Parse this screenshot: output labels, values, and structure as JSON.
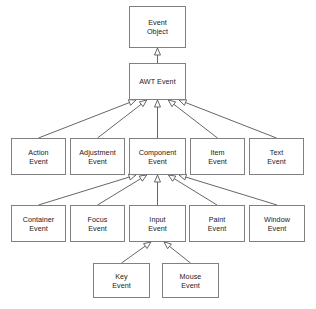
{
  "diagram": {
    "type": "uml-class-hierarchy",
    "relationship": "generalization",
    "arrow_style": "hollow-triangle",
    "colors": {
      "background": "#ffffff",
      "box_fill": "#ffffff",
      "box_border": "#808080",
      "edge_line": "#555555",
      "text": "#1a1a1a"
    },
    "nodes": [
      {
        "id": "event_object",
        "label": "Event\nObject",
        "x": 129,
        "y": 6,
        "w": 57,
        "h": 42,
        "level": 0
      },
      {
        "id": "awt_event",
        "label": "AWT Event",
        "x": 129,
        "y": 63,
        "w": 57,
        "h": 37,
        "level": 1
      },
      {
        "id": "action_event",
        "label": "Action\nEvent",
        "x": 11,
        "y": 138,
        "w": 55,
        "h": 37,
        "level": 2
      },
      {
        "id": "adjustment_event",
        "label": "Adjustment\nEvent",
        "x": 70,
        "y": 138,
        "w": 55,
        "h": 37,
        "level": 2
      },
      {
        "id": "component_event",
        "label": "Component\nEvent",
        "x": 129,
        "y": 138,
        "w": 57,
        "h": 37,
        "level": 2
      },
      {
        "id": "item_event",
        "label": "Item\nEvent",
        "x": 190,
        "y": 138,
        "w": 55,
        "h": 37,
        "level": 2
      },
      {
        "id": "text_event",
        "label": "Text\nEvent",
        "x": 249,
        "y": 138,
        "w": 55,
        "h": 37,
        "level": 2
      },
      {
        "id": "container_event",
        "label": "Container\nEvent",
        "x": 11,
        "y": 205,
        "w": 55,
        "h": 37,
        "level": 3
      },
      {
        "id": "focus_event",
        "label": "Focus\nEvent",
        "x": 70,
        "y": 205,
        "w": 55,
        "h": 37,
        "level": 3
      },
      {
        "id": "input_event",
        "label": "Input\nEvent",
        "x": 129,
        "y": 205,
        "w": 57,
        "h": 37,
        "level": 3
      },
      {
        "id": "paint_event",
        "label": "Paint\nEvent",
        "x": 189,
        "y": 205,
        "w": 56,
        "h": 37,
        "level": 3
      },
      {
        "id": "window_event",
        "label": "Window\nEvent",
        "x": 249,
        "y": 205,
        "w": 56,
        "h": 37,
        "level": 3
      },
      {
        "id": "key_event",
        "label": "Key\nEvent",
        "x": 93,
        "y": 263,
        "w": 57,
        "h": 35,
        "level": 4
      },
      {
        "id": "mouse_event",
        "label": "Mouse\nEvent",
        "x": 162,
        "y": 263,
        "w": 57,
        "h": 35,
        "level": 4
      }
    ],
    "edges": [
      {
        "from": "awt_event",
        "to": "event_object"
      },
      {
        "from": "action_event",
        "to": "awt_event"
      },
      {
        "from": "adjustment_event",
        "to": "awt_event"
      },
      {
        "from": "component_event",
        "to": "awt_event"
      },
      {
        "from": "item_event",
        "to": "awt_event"
      },
      {
        "from": "text_event",
        "to": "awt_event"
      },
      {
        "from": "container_event",
        "to": "component_event"
      },
      {
        "from": "focus_event",
        "to": "component_event"
      },
      {
        "from": "input_event",
        "to": "component_event"
      },
      {
        "from": "paint_event",
        "to": "component_event"
      },
      {
        "from": "window_event",
        "to": "component_event"
      },
      {
        "from": "key_event",
        "to": "input_event"
      },
      {
        "from": "mouse_event",
        "to": "input_event"
      }
    ]
  }
}
